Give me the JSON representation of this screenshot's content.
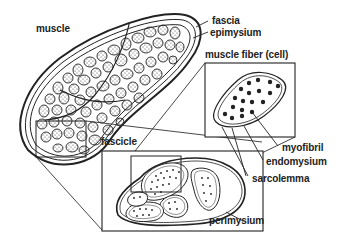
{
  "diagram": {
    "colors": {
      "line": "#222222",
      "fill": "#ffffff",
      "stipple": "#555555"
    },
    "labels": {
      "muscle": "muscle",
      "fascia": "fascia",
      "epimysium": "epimysium",
      "muscle_fiber": "muscle fiber (cell)",
      "myofibril": "myofibril",
      "endomysium": "endomysium",
      "sarcolemma": "sarcolemma",
      "fascicle": "fascicle",
      "perimysium": "perimysium"
    }
  }
}
